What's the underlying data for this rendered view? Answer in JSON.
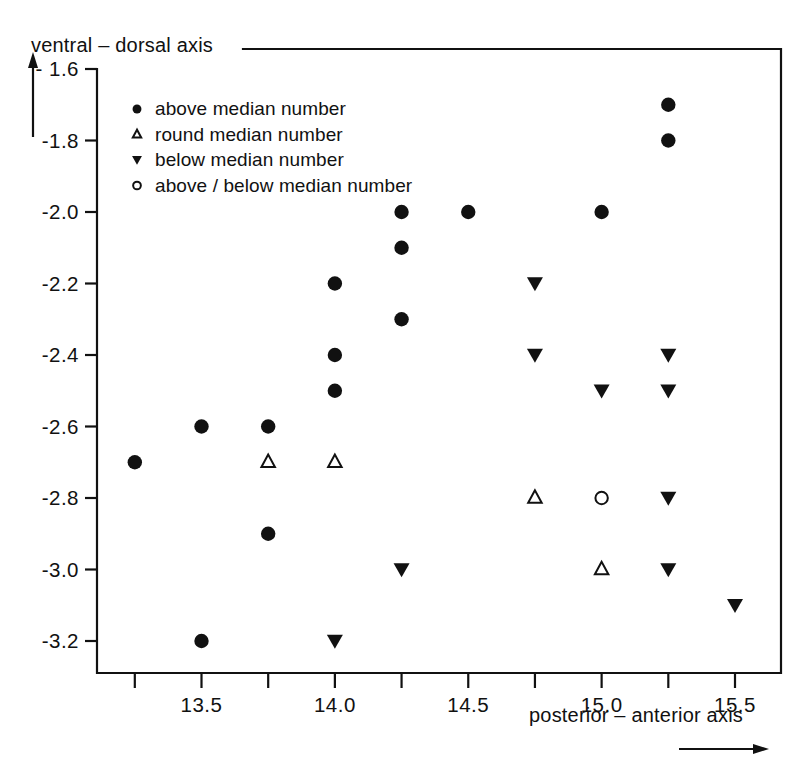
{
  "chart_data": {
    "type": "scatter",
    "title": "",
    "xlabel": "posterior – anterior axis",
    "ylabel": "ventral – dorsal axis",
    "xlim": [
      13.125,
      15.625
    ],
    "ylim": [
      -3.3,
      -1.55
    ],
    "grid": false,
    "xticks": [
      13.25,
      13.5,
      13.75,
      14.0,
      14.25,
      14.5,
      14.75,
      15.0,
      15.25,
      15.5
    ],
    "xtick_labels": [
      "",
      "13.5",
      "",
      "14.0",
      "",
      "14.5",
      "",
      "15.0",
      "",
      "15.5"
    ],
    "yticks": [
      -1.6,
      -1.8,
      -2.0,
      -2.2,
      -2.4,
      -2.6,
      -2.8,
      -3.0,
      -3.2
    ],
    "ytick_labels": [
      "- 1.6",
      "-1.8",
      "-2.0",
      "-2.2",
      "-2.4",
      "-2.6",
      "-2.8",
      "-3.0",
      "-3.2"
    ],
    "legend_position": "upper-left-inside",
    "series": [
      {
        "name": "above median number",
        "marker": "filled-circle",
        "points": [
          {
            "x": 13.25,
            "y": -2.7
          },
          {
            "x": 13.5,
            "y": -2.6
          },
          {
            "x": 13.5,
            "y": -3.2
          },
          {
            "x": 13.75,
            "y": -2.6
          },
          {
            "x": 13.75,
            "y": -2.9
          },
          {
            "x": 14.0,
            "y": -2.2
          },
          {
            "x": 14.0,
            "y": -2.4
          },
          {
            "x": 14.0,
            "y": -2.5
          },
          {
            "x": 14.25,
            "y": -2.0
          },
          {
            "x": 14.25,
            "y": -2.1
          },
          {
            "x": 14.25,
            "y": -2.3
          },
          {
            "x": 14.5,
            "y": -2.0
          },
          {
            "x": 15.0,
            "y": -2.0
          },
          {
            "x": 15.25,
            "y": -1.7
          },
          {
            "x": 15.25,
            "y": -1.8
          }
        ]
      },
      {
        "name": "round median number",
        "marker": "open-triangle-up",
        "points": [
          {
            "x": 13.75,
            "y": -2.7
          },
          {
            "x": 14.0,
            "y": -2.7
          },
          {
            "x": 14.75,
            "y": -2.8
          },
          {
            "x": 15.0,
            "y": -3.0
          }
        ]
      },
      {
        "name": "below median number",
        "marker": "filled-triangle-down",
        "points": [
          {
            "x": 14.0,
            "y": -3.2
          },
          {
            "x": 14.25,
            "y": -3.0
          },
          {
            "x": 14.75,
            "y": -2.2
          },
          {
            "x": 14.75,
            "y": -2.4
          },
          {
            "x": 15.0,
            "y": -2.5
          },
          {
            "x": 15.25,
            "y": -2.4
          },
          {
            "x": 15.25,
            "y": -2.5
          },
          {
            "x": 15.25,
            "y": -2.8
          },
          {
            "x": 15.25,
            "y": -3.0
          },
          {
            "x": 15.5,
            "y": -3.1
          }
        ]
      },
      {
        "name": "above / below median number",
        "marker": "open-circle",
        "points": [
          {
            "x": 15.0,
            "y": -2.8
          }
        ]
      }
    ]
  },
  "legend": {
    "entries": [
      {
        "marker": "filled-circle",
        "label": "above  median number"
      },
      {
        "marker": "open-triangle-up",
        "label": "round  median number"
      },
      {
        "marker": "filled-triangle-down",
        "label": "below  median  number"
      },
      {
        "marker": "open-circle",
        "label": "above / below median number"
      }
    ]
  },
  "axes": {
    "y_title": "ventral –  dorsal axis",
    "x_title": "posterior –  anterior axis"
  },
  "colors": {
    "ink": "#111111",
    "background": "#ffffff"
  }
}
